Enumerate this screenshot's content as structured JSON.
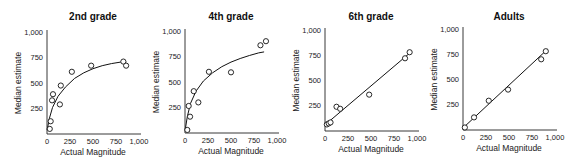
{
  "figure": {
    "background": "#ffffff",
    "ink_color": "#111111"
  },
  "chart_data": [
    {
      "type": "scatter",
      "title": "2nd grade",
      "xlabel": "Actual Magnitude",
      "ylabel": "Median estimate",
      "xlim": [
        0,
        1000
      ],
      "ylim": [
        0,
        1000
      ],
      "xticks": [
        "0",
        "250",
        "500",
        "750",
        "1,000"
      ],
      "yticks": [
        "250",
        "500",
        "750",
        "1,000"
      ],
      "grid": false,
      "fit": "logarithmic",
      "points": [
        {
          "x": 30,
          "y": 50
        },
        {
          "x": 40,
          "y": 125
        },
        {
          "x": 55,
          "y": 330
        },
        {
          "x": 65,
          "y": 390
        },
        {
          "x": 140,
          "y": 290
        },
        {
          "x": 150,
          "y": 475
        },
        {
          "x": 270,
          "y": 610
        },
        {
          "x": 480,
          "y": 670
        },
        {
          "x": 830,
          "y": 710
        },
        {
          "x": 860,
          "y": 670
        }
      ],
      "fit_curve": [
        {
          "x": 2,
          "y": 40
        },
        {
          "x": 25,
          "y": 150
        },
        {
          "x": 60,
          "y": 260
        },
        {
          "x": 120,
          "y": 370
        },
        {
          "x": 200,
          "y": 460
        },
        {
          "x": 300,
          "y": 545
        },
        {
          "x": 400,
          "y": 600
        },
        {
          "x": 500,
          "y": 640
        },
        {
          "x": 600,
          "y": 670
        },
        {
          "x": 700,
          "y": 690
        },
        {
          "x": 800,
          "y": 705
        },
        {
          "x": 860,
          "y": 705
        }
      ]
    },
    {
      "type": "scatter",
      "title": "4th grade",
      "xlabel": "Actual Magnitude",
      "ylabel": "Median estimate",
      "xlim": [
        0,
        1000
      ],
      "ylim": [
        0,
        1000
      ],
      "xticks": [
        "0",
        "250",
        "500",
        "750",
        "1,000"
      ],
      "yticks": [
        "250",
        "500",
        "750",
        "1,000"
      ],
      "grid": false,
      "fit": "logarithmic",
      "points": [
        {
          "x": 25,
          "y": 30
        },
        {
          "x": 55,
          "y": 160
        },
        {
          "x": 40,
          "y": 265
        },
        {
          "x": 95,
          "y": 410
        },
        {
          "x": 145,
          "y": 300
        },
        {
          "x": 260,
          "y": 600
        },
        {
          "x": 500,
          "y": 595
        },
        {
          "x": 820,
          "y": 860
        },
        {
          "x": 880,
          "y": 900
        }
      ],
      "fit_curve": [
        {
          "x": 2,
          "y": 30
        },
        {
          "x": 25,
          "y": 160
        },
        {
          "x": 60,
          "y": 290
        },
        {
          "x": 120,
          "y": 410
        },
        {
          "x": 200,
          "y": 510
        },
        {
          "x": 300,
          "y": 590
        },
        {
          "x": 400,
          "y": 650
        },
        {
          "x": 500,
          "y": 695
        },
        {
          "x": 600,
          "y": 730
        },
        {
          "x": 700,
          "y": 760
        },
        {
          "x": 800,
          "y": 785
        },
        {
          "x": 860,
          "y": 795
        }
      ]
    },
    {
      "type": "scatter",
      "title": "6th grade",
      "xlabel": "Actual Magnitude",
      "ylabel": "Median estimate",
      "xlim": [
        0,
        1000
      ],
      "ylim": [
        0,
        1000
      ],
      "xticks": [
        "0",
        "250",
        "500",
        "750",
        "1,000"
      ],
      "yticks": [
        "250",
        "500",
        "750",
        "1,000"
      ],
      "grid": false,
      "fit": "linear",
      "points": [
        {
          "x": 20,
          "y": 65
        },
        {
          "x": 40,
          "y": 75
        },
        {
          "x": 60,
          "y": 85
        },
        {
          "x": 125,
          "y": 240
        },
        {
          "x": 165,
          "y": 220
        },
        {
          "x": 480,
          "y": 360
        },
        {
          "x": 870,
          "y": 720
        },
        {
          "x": 920,
          "y": 780
        }
      ],
      "fit_curve": [
        {
          "x": 0,
          "y": 60
        },
        {
          "x": 920,
          "y": 770
        }
      ]
    },
    {
      "type": "scatter",
      "title": "Adults",
      "xlabel": "Actual Magnitude",
      "ylabel": "Median estimate",
      "xlim": [
        0,
        1000
      ],
      "ylim": [
        0,
        1000
      ],
      "xticks": [
        "0",
        "250",
        "500",
        "750",
        "1,000"
      ],
      "yticks": [
        "250",
        "500",
        "750",
        "1,000"
      ],
      "grid": false,
      "fit": "linear",
      "points": [
        {
          "x": 20,
          "y": 25
        },
        {
          "x": 120,
          "y": 125
        },
        {
          "x": 280,
          "y": 290
        },
        {
          "x": 490,
          "y": 400
        },
        {
          "x": 850,
          "y": 700
        },
        {
          "x": 900,
          "y": 780
        }
      ],
      "fit_curve": [
        {
          "x": 0,
          "y": 20
        },
        {
          "x": 920,
          "y": 800
        }
      ]
    }
  ],
  "layout": {
    "panels": [
      {
        "left": 0,
        "axis_x0": 47,
        "axis_x1": 139,
        "axis_y0": 134,
        "axis_y1": 32
      },
      {
        "left": 140,
        "axis_x0": 45,
        "axis_x1": 137,
        "axis_y0": 133,
        "axis_y1": 31
      },
      {
        "left": 290,
        "axis_x0": 35,
        "axis_x1": 127,
        "axis_y0": 131,
        "axis_y1": 30
      },
      {
        "left": 433,
        "axis_x0": 30,
        "axis_x1": 122,
        "axis_y0": 130,
        "axis_y1": 29
      }
    ]
  }
}
